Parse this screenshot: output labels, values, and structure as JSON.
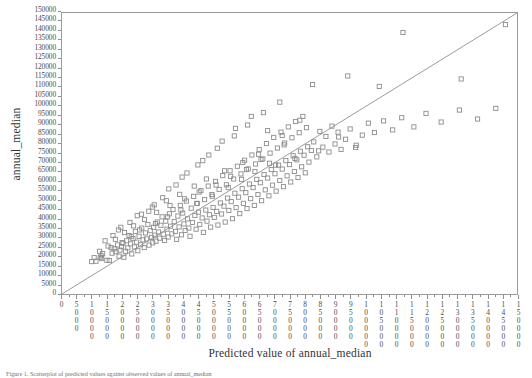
{
  "figure": {
    "caption": "Figure 1. Scatterplot of predicted values against observed values of annual_median",
    "marker_color": "#8c8c8c",
    "line_color": "#9a9a9a",
    "frame_color": "#9a9a9a"
  },
  "axes": {
    "ylabel": "annual_median",
    "xlabel": "Predicted value of annual_median",
    "yticks": [
      0,
      5000,
      10000,
      15000,
      20000,
      25000,
      30000,
      35000,
      40000,
      45000,
      50000,
      55000,
      60000,
      65000,
      70000,
      75000,
      80000,
      85000,
      90000,
      95000,
      100000,
      105000,
      110000,
      115000,
      120000,
      125000,
      130000,
      135000,
      140000,
      145000,
      150000
    ],
    "xticks": [
      0,
      5000,
      10000,
      15000,
      20000,
      25000,
      30000,
      35000,
      40000,
      45000,
      50000,
      55000,
      60000,
      65000,
      70000,
      75000,
      80000,
      85000,
      90000,
      95000,
      100000,
      105000,
      110000,
      115000,
      120000,
      125000,
      130000,
      135000,
      140000,
      145000,
      150000
    ]
  },
  "chart_data": {
    "type": "scatter",
    "title": "",
    "xlabel": "Predicted value of annual_median",
    "ylabel": "annual_median",
    "xlim": [
      0,
      150000
    ],
    "ylim": [
      0,
      150000
    ],
    "grid": false,
    "legend": null,
    "reference_line": {
      "type": "identity",
      "from": [
        0,
        0
      ],
      "to": [
        150000,
        150000
      ]
    },
    "marker": "open-square",
    "points": [
      [
        9800,
        17300
      ],
      [
        11200,
        17500
      ],
      [
        12600,
        19600
      ],
      [
        12900,
        20400
      ],
      [
        13100,
        18900
      ],
      [
        14800,
        18000
      ],
      [
        15600,
        17900
      ],
      [
        16500,
        21800
      ],
      [
        17200,
        24100
      ],
      [
        17800,
        22600
      ],
      [
        18300,
        26200
      ],
      [
        18800,
        20200
      ],
      [
        19100,
        23400
      ],
      [
        19600,
        25300
      ],
      [
        20100,
        27100
      ],
      [
        20400,
        19600
      ],
      [
        20900,
        22800
      ],
      [
        21300,
        28400
      ],
      [
        21700,
        24600
      ],
      [
        22100,
        31200
      ],
      [
        22600,
        26800
      ],
      [
        23000,
        21400
      ],
      [
        23400,
        29600
      ],
      [
        23900,
        25100
      ],
      [
        24200,
        33400
      ],
      [
        24600,
        27700
      ],
      [
        25000,
        23100
      ],
      [
        25400,
        30800
      ],
      [
        25900,
        26300
      ],
      [
        26300,
        35200
      ],
      [
        26700,
        28900
      ],
      [
        27100,
        24800
      ],
      [
        27500,
        32600
      ],
      [
        27900,
        29400
      ],
      [
        28300,
        37100
      ],
      [
        28700,
        26100
      ],
      [
        29100,
        33800
      ],
      [
        29500,
        30200
      ],
      [
        29900,
        27300
      ],
      [
        30200,
        35600
      ],
      [
        30600,
        31400
      ],
      [
        31000,
        28200
      ],
      [
        31400,
        38400
      ],
      [
        31800,
        33100
      ],
      [
        32200,
        29800
      ],
      [
        32600,
        36700
      ],
      [
        33000,
        41200
      ],
      [
        33400,
        31900
      ],
      [
        33800,
        28600
      ],
      [
        34200,
        38900
      ],
      [
        34600,
        34600
      ],
      [
        35000,
        30400
      ],
      [
        35400,
        42800
      ],
      [
        35800,
        36200
      ],
      [
        36200,
        32100
      ],
      [
        36600,
        45100
      ],
      [
        37000,
        38600
      ],
      [
        37400,
        33400
      ],
      [
        37800,
        29200
      ],
      [
        38200,
        41600
      ],
      [
        38600,
        35800
      ],
      [
        39000,
        47300
      ],
      [
        39400,
        31600
      ],
      [
        39800,
        43200
      ],
      [
        40200,
        37400
      ],
      [
        40600,
        33900
      ],
      [
        41000,
        49600
      ],
      [
        41400,
        40100
      ],
      [
        41800,
        35200
      ],
      [
        42200,
        30800
      ],
      [
        42600,
        45800
      ],
      [
        43000,
        38200
      ],
      [
        43400,
        52100
      ],
      [
        43800,
        41900
      ],
      [
        44200,
        34600
      ],
      [
        44600,
        48300
      ],
      [
        45000,
        43700
      ],
      [
        45400,
        37100
      ],
      [
        45800,
        55200
      ],
      [
        46200,
        40600
      ],
      [
        46600,
        32900
      ],
      [
        47000,
        50400
      ],
      [
        47400,
        44800
      ],
      [
        47800,
        38900
      ],
      [
        48200,
        57600
      ],
      [
        48600,
        42300
      ],
      [
        49000,
        35700
      ],
      [
        49400,
        53100
      ],
      [
        49800,
        46200
      ],
      [
        50200,
        40900
      ],
      [
        50600,
        60100
      ],
      [
        51000,
        44100
      ],
      [
        51400,
        36800
      ],
      [
        51800,
        55800
      ],
      [
        52200,
        48600
      ],
      [
        52600,
        42700
      ],
      [
        53000,
        63200
      ],
      [
        53400,
        46900
      ],
      [
        53800,
        38400
      ],
      [
        54200,
        58300
      ],
      [
        54600,
        51200
      ],
      [
        55000,
        44600
      ],
      [
        55400,
        65800
      ],
      [
        55800,
        49300
      ],
      [
        56200,
        40200
      ],
      [
        56600,
        61400
      ],
      [
        57000,
        53800
      ],
      [
        57400,
        46100
      ],
      [
        57800,
        68200
      ],
      [
        58200,
        51700
      ],
      [
        58600,
        42900
      ],
      [
        59000,
        64100
      ],
      [
        59400,
        56200
      ],
      [
        59800,
        48400
      ],
      [
        60200,
        71400
      ],
      [
        60600,
        54100
      ],
      [
        61000,
        45600
      ],
      [
        61400,
        66800
      ],
      [
        61800,
        58700
      ],
      [
        62200,
        50900
      ],
      [
        62600,
        74200
      ],
      [
        63000,
        56800
      ],
      [
        63400,
        47300
      ],
      [
        63800,
        69400
      ],
      [
        64200,
        61200
      ],
      [
        64600,
        53100
      ],
      [
        65000,
        77100
      ],
      [
        65400,
        59400
      ],
      [
        65800,
        49800
      ],
      [
        66200,
        72100
      ],
      [
        66600,
        63800
      ],
      [
        67000,
        55600
      ],
      [
        67400,
        80300
      ],
      [
        67800,
        61900
      ],
      [
        68200,
        52400
      ],
      [
        68600,
        75200
      ],
      [
        69000,
        66400
      ],
      [
        69400,
        58100
      ],
      [
        69800,
        83600
      ],
      [
        70200,
        64200
      ],
      [
        70600,
        54900
      ],
      [
        71000,
        77900
      ],
      [
        71400,
        68800
      ],
      [
        71800,
        60600
      ],
      [
        72200,
        86400
      ],
      [
        72600,
        66700
      ],
      [
        73000,
        57300
      ],
      [
        73400,
        80600
      ],
      [
        73800,
        71200
      ],
      [
        74200,
        63100
      ],
      [
        74600,
        89200
      ],
      [
        75000,
        69100
      ],
      [
        75400,
        59800
      ],
      [
        75800,
        83400
      ],
      [
        76200,
        73800
      ],
      [
        76600,
        65400
      ],
      [
        77000,
        92100
      ],
      [
        77400,
        71600
      ],
      [
        77800,
        62200
      ],
      [
        78200,
        86100
      ],
      [
        78600,
        76200
      ],
      [
        79000,
        67900
      ],
      [
        79400,
        94800
      ],
      [
        79800,
        74100
      ],
      [
        80200,
        64700
      ],
      [
        80600,
        88800
      ],
      [
        81000,
        78600
      ],
      [
        81400,
        70400
      ],
      [
        82200,
        76600
      ],
      [
        83000,
        81200
      ],
      [
        84000,
        73200
      ],
      [
        85000,
        86800
      ],
      [
        86000,
        78400
      ],
      [
        87000,
        84100
      ],
      [
        88000,
        75800
      ],
      [
        89000,
        89600
      ],
      [
        90000,
        80100
      ],
      [
        91000,
        86400
      ],
      [
        92000,
        77200
      ],
      [
        93500,
        82600
      ],
      [
        95000,
        88100
      ],
      [
        97000,
        79400
      ],
      [
        99000,
        84800
      ],
      [
        101000,
        91200
      ],
      [
        103000,
        86200
      ],
      [
        106000,
        92400
      ],
      [
        109000,
        87600
      ],
      [
        112000,
        94100
      ],
      [
        116000,
        89200
      ],
      [
        120000,
        96400
      ],
      [
        125000,
        91800
      ],
      [
        131000,
        98200
      ],
      [
        137000,
        93400
      ],
      [
        143000,
        99100
      ],
      [
        18600,
        34200
      ],
      [
        30400,
        47600
      ],
      [
        35200,
        56100
      ],
      [
        39600,
        62400
      ],
      [
        44800,
        68900
      ],
      [
        48400,
        74200
      ],
      [
        52800,
        81600
      ],
      [
        57200,
        88400
      ],
      [
        62400,
        94800
      ],
      [
        67800,
        87200
      ],
      [
        73200,
        79600
      ],
      [
        78400,
        92800
      ],
      [
        84600,
        76400
      ],
      [
        91200,
        83800
      ],
      [
        96800,
        78200
      ],
      [
        24800,
        41800
      ],
      [
        28600,
        44200
      ],
      [
        33200,
        51400
      ],
      [
        37600,
        58200
      ],
      [
        41200,
        64600
      ],
      [
        46400,
        71200
      ],
      [
        51200,
        77800
      ],
      [
        56800,
        84400
      ],
      [
        61200,
        90200
      ],
      [
        66400,
        96800
      ],
      [
        71800,
        102400
      ],
      [
        82600,
        111800
      ],
      [
        94200,
        116400
      ],
      [
        104600,
        110800
      ],
      [
        112400,
        139600
      ],
      [
        131600,
        114800
      ],
      [
        146200,
        143800
      ],
      [
        14200,
        28400
      ],
      [
        16800,
        31200
      ],
      [
        19400,
        35600
      ],
      [
        22400,
        38200
      ],
      [
        26200,
        42600
      ],
      [
        29800,
        46400
      ],
      [
        34400,
        49800
      ],
      [
        38800,
        53200
      ],
      [
        43600,
        57600
      ],
      [
        47600,
        61400
      ],
      [
        53600,
        65800
      ],
      [
        59600,
        70200
      ],
      [
        64800,
        74600
      ],
      [
        70400,
        68800
      ],
      [
        76800,
        72400
      ],
      [
        12400,
        22800
      ],
      [
        15200,
        25600
      ],
      [
        17600,
        29200
      ],
      [
        20600,
        32800
      ],
      [
        23600,
        36400
      ],
      [
        27200,
        39800
      ],
      [
        31200,
        43600
      ],
      [
        35600,
        47200
      ],
      [
        40400,
        50800
      ],
      [
        45200,
        54400
      ],
      [
        50800,
        58200
      ],
      [
        55600,
        62800
      ],
      [
        60800,
        66400
      ],
      [
        65600,
        71800
      ],
      [
        72600,
        84600
      ],
      [
        10600,
        19400
      ],
      [
        13400,
        21600
      ],
      [
        16200,
        24800
      ],
      [
        19800,
        27400
      ],
      [
        22800,
        30600
      ],
      [
        25600,
        34200
      ],
      [
        30800,
        37600
      ],
      [
        34800,
        41200
      ],
      [
        39200,
        44800
      ],
      [
        44400,
        48400
      ],
      [
        49600,
        52200
      ],
      [
        54800,
        56800
      ],
      [
        59200,
        61200
      ],
      [
        63600,
        65400
      ],
      [
        68400,
        69800
      ]
    ]
  }
}
